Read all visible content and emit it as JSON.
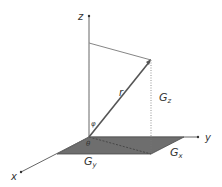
{
  "diagram": {
    "type": "3d-coordinate-vector-diagram",
    "axes": {
      "z": {
        "label": "z"
      },
      "y": {
        "label": "y"
      },
      "x": {
        "label": "x"
      }
    },
    "vector": {
      "label": "r"
    },
    "angles": {
      "polar": {
        "label": "φ"
      },
      "azimuth": {
        "label": "θ"
      }
    },
    "components": {
      "gz": {
        "base": "G",
        "sub": "z"
      },
      "gx": {
        "base": "G",
        "sub": "x"
      },
      "gy": {
        "base": "G",
        "sub": "y"
      }
    },
    "colors": {
      "axis": "#555555",
      "vector": "#555555",
      "plane_fill": "#6e6e6e",
      "plane_stroke": "#4a4a4a",
      "guide": "#888888",
      "text": "#333333"
    }
  }
}
